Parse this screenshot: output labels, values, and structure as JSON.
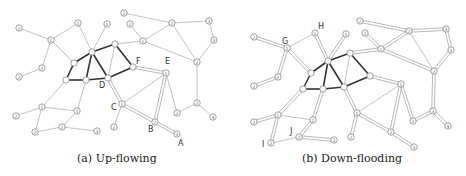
{
  "panels": [
    {
      "id": "a",
      "caption": "(a) Up-flowing",
      "nodes": [
        {
          "id": "n1",
          "x": 19,
          "y": 28,
          "label": "2"
        },
        {
          "id": "n2",
          "x": 51,
          "y": 40,
          "label": "1"
        },
        {
          "id": "n3",
          "x": 78,
          "y": 23,
          "label": "1"
        },
        {
          "id": "n4",
          "x": 107,
          "y": 24,
          "label": "1"
        },
        {
          "id": "n5",
          "x": 124,
          "y": 13,
          "label": "2"
        },
        {
          "id": "n6",
          "x": 130,
          "y": 24,
          "label": "2"
        },
        {
          "id": "n7",
          "x": 143,
          "y": 41,
          "label": "1"
        },
        {
          "id": "n8",
          "x": 172,
          "y": 23,
          "label": "2"
        },
        {
          "id": "n9",
          "x": 209,
          "y": 21,
          "label": "3"
        },
        {
          "id": "n10",
          "x": 214,
          "y": 40,
          "label": "3"
        },
        {
          "id": "n11",
          "x": 197,
          "y": 62,
          "label": "2"
        },
        {
          "id": "n12",
          "x": 42,
          "y": 68,
          "label": "2"
        },
        {
          "id": "n13",
          "x": 19,
          "y": 77,
          "label": "2"
        },
        {
          "id": "c1",
          "x": 92,
          "y": 52,
          "label": ""
        },
        {
          "id": "c2",
          "x": 115,
          "y": 44,
          "label": ""
        },
        {
          "id": "c3",
          "x": 74,
          "y": 63,
          "label": ""
        },
        {
          "id": "c4",
          "x": 66,
          "y": 80,
          "label": ""
        },
        {
          "id": "c5",
          "x": 86,
          "y": 80,
          "label": ""
        },
        {
          "id": "D",
          "x": 108,
          "y": 78,
          "label": ""
        },
        {
          "id": "F",
          "x": 133,
          "y": 67,
          "label": ""
        },
        {
          "id": "E",
          "x": 166,
          "y": 73,
          "label": "1"
        },
        {
          "id": "C",
          "x": 122,
          "y": 104,
          "label": "1"
        },
        {
          "id": "B",
          "x": 155,
          "y": 122,
          "label": "2"
        },
        {
          "id": "A",
          "x": 177,
          "y": 134,
          "label": "3"
        },
        {
          "id": "n14",
          "x": 114,
          "y": 127,
          "label": "2"
        },
        {
          "id": "n15",
          "x": 177,
          "y": 113,
          "label": "2"
        },
        {
          "id": "n16",
          "x": 197,
          "y": 103,
          "label": "2"
        },
        {
          "id": "n17",
          "x": 213,
          "y": 117,
          "label": "4"
        },
        {
          "id": "n18",
          "x": 42,
          "y": 107,
          "label": "1"
        },
        {
          "id": "n19",
          "x": 16,
          "y": 116,
          "label": "2"
        },
        {
          "id": "n20",
          "x": 77,
          "y": 111,
          "label": "1"
        },
        {
          "id": "n21",
          "x": 35,
          "y": 132,
          "label": "2"
        },
        {
          "id": "n22",
          "x": 62,
          "y": 127,
          "label": "2"
        },
        {
          "id": "n23",
          "x": 97,
          "y": 131,
          "label": "3"
        }
      ],
      "letters": [
        {
          "text": "D",
          "x": 99,
          "y": 88
        },
        {
          "text": "F",
          "x": 136,
          "y": 64
        },
        {
          "text": "E",
          "x": 165,
          "y": 64
        },
        {
          "text": "C",
          "x": 111,
          "y": 110
        },
        {
          "text": "B",
          "x": 148,
          "y": 132
        },
        {
          "text": "A",
          "x": 178,
          "y": 146
        }
      ],
      "edges": [
        [
          "n1",
          "n2",
          "thin"
        ],
        [
          "n2",
          "n3",
          "thin"
        ],
        [
          "n3",
          "c1",
          "thin"
        ],
        [
          "n2",
          "c3",
          "thin"
        ],
        [
          "n2",
          "n12",
          "thin"
        ],
        [
          "n12",
          "n13",
          "thin"
        ],
        [
          "n4",
          "c1",
          "thin"
        ],
        [
          "n5",
          "n8",
          "thin"
        ],
        [
          "n6",
          "n7",
          "thin"
        ],
        [
          "n7",
          "c2",
          "thin"
        ],
        [
          "n7",
          "n8",
          "thin"
        ],
        [
          "n7",
          "n11",
          "thin"
        ],
        [
          "n8",
          "n9",
          "thin"
        ],
        [
          "n9",
          "n10",
          "thin"
        ],
        [
          "n10",
          "n11",
          "thin"
        ],
        [
          "n8",
          "n11",
          "thin"
        ],
        [
          "n11",
          "n16",
          "thin"
        ],
        [
          "n16",
          "n15",
          "thin"
        ],
        [
          "n16",
          "n17",
          "thin"
        ],
        [
          "c1",
          "c2",
          "thick"
        ],
        [
          "c1",
          "c3",
          "thick"
        ],
        [
          "c3",
          "c4",
          "thick"
        ],
        [
          "c4",
          "c5",
          "thick"
        ],
        [
          "c5",
          "D",
          "thick"
        ],
        [
          "D",
          "F",
          "thick"
        ],
        [
          "c2",
          "F",
          "thick"
        ],
        [
          "c1",
          "c5",
          "thick"
        ],
        [
          "c1",
          "D",
          "thick"
        ],
        [
          "c2",
          "D",
          "thin"
        ],
        [
          "F",
          "E",
          "double"
        ],
        [
          "E",
          "B",
          "double"
        ],
        [
          "B",
          "A",
          "double"
        ],
        [
          "D",
          "C",
          "double"
        ],
        [
          "C",
          "B",
          "double"
        ],
        [
          "C",
          "E",
          "thin"
        ],
        [
          "E",
          "n15",
          "thin"
        ],
        [
          "C",
          "n14",
          "thin"
        ],
        [
          "c4",
          "n18",
          "thin"
        ],
        [
          "c5",
          "n20",
          "thin"
        ],
        [
          "n18",
          "n19",
          "thin"
        ],
        [
          "n18",
          "n20",
          "thin"
        ],
        [
          "n18",
          "n21",
          "thin"
        ],
        [
          "n20",
          "n22",
          "thin"
        ],
        [
          "n21",
          "n22",
          "thin"
        ],
        [
          "n22",
          "n23",
          "thin"
        ]
      ]
    },
    {
      "id": "b",
      "caption": "(b) Down-flooding",
      "nodes": [
        {
          "id": "m1",
          "x": 254,
          "y": 37,
          "label": "2"
        },
        {
          "id": "G",
          "x": 287,
          "y": 48,
          "label": "1"
        },
        {
          "id": "H",
          "x": 315,
          "y": 33,
          "label": "1"
        },
        {
          "id": "m2",
          "x": 346,
          "y": 34,
          "label": "1"
        },
        {
          "id": "m3",
          "x": 360,
          "y": 21,
          "label": "2"
        },
        {
          "id": "m4",
          "x": 365,
          "y": 33,
          "label": "2"
        },
        {
          "id": "m5",
          "x": 381,
          "y": 49,
          "label": "1"
        },
        {
          "id": "m6",
          "x": 409,
          "y": 31,
          "label": "2"
        },
        {
          "id": "m7",
          "x": 446,
          "y": 29,
          "label": "3"
        },
        {
          "id": "m8",
          "x": 451,
          "y": 50,
          "label": "3"
        },
        {
          "id": "m9",
          "x": 434,
          "y": 71,
          "label": "2"
        },
        {
          "id": "m10",
          "x": 278,
          "y": 77,
          "label": "2"
        },
        {
          "id": "m11",
          "x": 254,
          "y": 86,
          "label": "2"
        },
        {
          "id": "d1",
          "x": 328,
          "y": 61,
          "label": ""
        },
        {
          "id": "d2",
          "x": 350,
          "y": 53,
          "label": ""
        },
        {
          "id": "d3",
          "x": 311,
          "y": 73,
          "label": ""
        },
        {
          "id": "d4",
          "x": 303,
          "y": 89,
          "label": ""
        },
        {
          "id": "d5",
          "x": 323,
          "y": 89,
          "label": ""
        },
        {
          "id": "d6",
          "x": 344,
          "y": 87,
          "label": ""
        },
        {
          "id": "d7",
          "x": 370,
          "y": 76,
          "label": ""
        },
        {
          "id": "m12",
          "x": 401,
          "y": 84,
          "label": "1"
        },
        {
          "id": "m13",
          "x": 357,
          "y": 113,
          "label": "1"
        },
        {
          "id": "m14",
          "x": 391,
          "y": 132,
          "label": "2"
        },
        {
          "id": "m15",
          "x": 414,
          "y": 147,
          "label": "3"
        },
        {
          "id": "m16",
          "x": 351,
          "y": 137,
          "label": "2"
        },
        {
          "id": "m17",
          "x": 413,
          "y": 121,
          "label": "2"
        },
        {
          "id": "m18",
          "x": 433,
          "y": 111,
          "label": "3"
        },
        {
          "id": "m19",
          "x": 448,
          "y": 126,
          "label": "4"
        },
        {
          "id": "m20",
          "x": 278,
          "y": 115,
          "label": "1"
        },
        {
          "id": "m21",
          "x": 254,
          "y": 122,
          "label": "2"
        },
        {
          "id": "m22",
          "x": 313,
          "y": 120,
          "label": "1"
        },
        {
          "id": "I",
          "x": 271,
          "y": 143,
          "label": "2"
        },
        {
          "id": "J",
          "x": 299,
          "y": 137,
          "label": "2"
        },
        {
          "id": "m23",
          "x": 334,
          "y": 140,
          "label": "3"
        }
      ],
      "letters": [
        {
          "text": "G",
          "x": 282,
          "y": 44
        },
        {
          "text": "H",
          "x": 318,
          "y": 29
        },
        {
          "text": "I",
          "x": 262,
          "y": 147
        },
        {
          "text": "J",
          "x": 290,
          "y": 134
        }
      ],
      "edges": [
        [
          "m1",
          "G",
          "double"
        ],
        [
          "G",
          "H",
          "thin"
        ],
        [
          "H",
          "d1",
          "double"
        ],
        [
          "G",
          "d3",
          "double"
        ],
        [
          "G",
          "m10",
          "double"
        ],
        [
          "m10",
          "m11",
          "double"
        ],
        [
          "m2",
          "d1",
          "double"
        ],
        [
          "m3",
          "m6",
          "double"
        ],
        [
          "m4",
          "m5",
          "double"
        ],
        [
          "m5",
          "d2",
          "double"
        ],
        [
          "m5",
          "m6",
          "double"
        ],
        [
          "m5",
          "m9",
          "double"
        ],
        [
          "m6",
          "m7",
          "double"
        ],
        [
          "m7",
          "m8",
          "double"
        ],
        [
          "m8",
          "m9",
          "double"
        ],
        [
          "m6",
          "m9",
          "thin"
        ],
        [
          "m9",
          "m18",
          "double"
        ],
        [
          "m18",
          "m17",
          "double"
        ],
        [
          "m18",
          "m19",
          "double"
        ],
        [
          "d1",
          "d2",
          "thick"
        ],
        [
          "d1",
          "d3",
          "thick"
        ],
        [
          "d3",
          "d4",
          "thick"
        ],
        [
          "d4",
          "d5",
          "thick"
        ],
        [
          "d5",
          "d6",
          "thick"
        ],
        [
          "d6",
          "d7",
          "thick"
        ],
        [
          "d2",
          "d7",
          "thick"
        ],
        [
          "d1",
          "d5",
          "thick"
        ],
        [
          "d1",
          "d6",
          "thick"
        ],
        [
          "d2",
          "d6",
          "thin"
        ],
        [
          "d7",
          "m12",
          "double"
        ],
        [
          "m12",
          "m14",
          "double"
        ],
        [
          "m14",
          "m15",
          "double"
        ],
        [
          "d6",
          "m13",
          "double"
        ],
        [
          "m13",
          "m14",
          "double"
        ],
        [
          "m13",
          "m12",
          "thin"
        ],
        [
          "m12",
          "m17",
          "double"
        ],
        [
          "m13",
          "m16",
          "double"
        ],
        [
          "d4",
          "m20",
          "double"
        ],
        [
          "d5",
          "m22",
          "double"
        ],
        [
          "m20",
          "m21",
          "double"
        ],
        [
          "m20",
          "m22",
          "thin"
        ],
        [
          "m20",
          "I",
          "double"
        ],
        [
          "m22",
          "J",
          "double"
        ],
        [
          "I",
          "J",
          "thin"
        ],
        [
          "J",
          "m23",
          "double"
        ]
      ]
    }
  ]
}
